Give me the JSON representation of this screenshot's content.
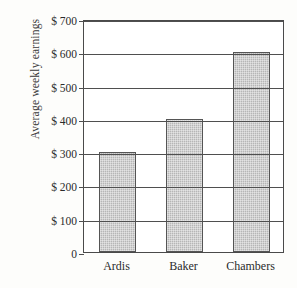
{
  "chart_data": {
    "type": "bar",
    "title": "",
    "xlabel": "",
    "ylabel": "Average weekly earnings",
    "categories": [
      "Ardis",
      "Baker",
      "Chambers"
    ],
    "values": [
      300,
      400,
      600
    ],
    "ylim": [
      0,
      700
    ],
    "yticks": [
      0,
      100,
      200,
      300,
      400,
      500,
      600,
      700
    ],
    "ytick_labels": [
      "0",
      "$ 100",
      "$ 200",
      "$ 300",
      "$ 400",
      "$ 500",
      "$ 600",
      "$ 700"
    ],
    "grid": true,
    "legend": null,
    "bar_fill_color": "#b6b6b6",
    "bar_edge_color": "#555555",
    "axis_color": "#4a4a4a",
    "background_color": "#fdfdfb",
    "plot_background_color": "#ffffff"
  },
  "axis": {
    "y_title": "Average weekly earnings",
    "ticks": [
      {
        "label": "$ 700",
        "value": 700
      },
      {
        "label": "$ 600",
        "value": 600
      },
      {
        "label": "$ 500",
        "value": 500
      },
      {
        "label": "$ 400",
        "value": 400
      },
      {
        "label": "$ 300",
        "value": 300
      },
      {
        "label": "$ 200",
        "value": 200
      },
      {
        "label": "$ 100",
        "value": 100
      },
      {
        "label": "0",
        "value": 0
      }
    ]
  },
  "bars": [
    {
      "category": "Ardis",
      "value": 300,
      "value_label": "$300"
    },
    {
      "category": "Baker",
      "value": 400,
      "value_label": "$400"
    },
    {
      "category": "Chambers",
      "value": 600,
      "value_label": "$600"
    }
  ]
}
